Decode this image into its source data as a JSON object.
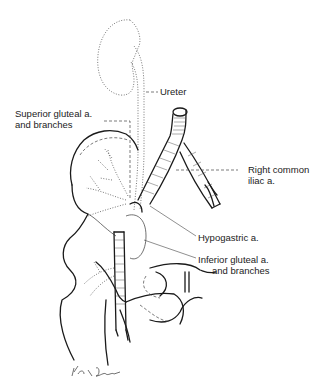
{
  "figure": {
    "type": "anatomical illustration",
    "labels": {
      "ureter": "Ureter",
      "superior_gluteal_line1": "Superior gluteal a.",
      "superior_gluteal_line2": "and branches",
      "right_common_iliac_line1": "Right common",
      "right_common_iliac_line2": "iliac a.",
      "hypogastric": "Hypogastric a.",
      "inferior_gluteal_line1": "Inferior gluteal a.",
      "inferior_gluteal_line2": "and branches"
    },
    "signature": "Kurt Scheler"
  }
}
